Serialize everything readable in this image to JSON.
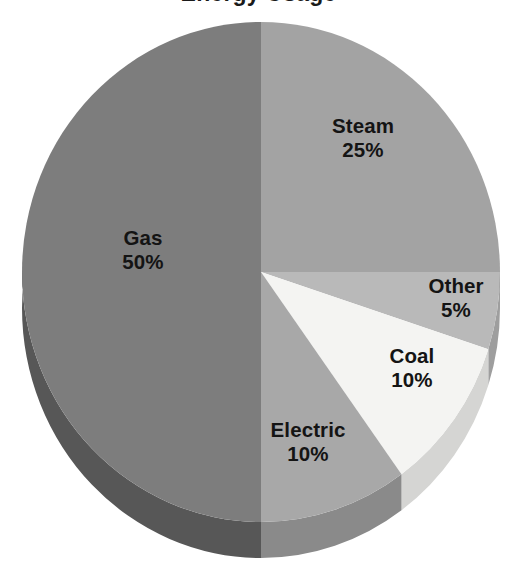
{
  "chart_data": {
    "type": "pie",
    "title": "Energy Usage",
    "title_cropped": true,
    "xlabel": "",
    "ylabel": "",
    "legend_position": "none",
    "grid": false,
    "labels_on_slices": true,
    "three_d": true,
    "start_angle_deg": 0,
    "direction": "clockwise",
    "categories": [
      "Steam",
      "Other",
      "Coal",
      "Electric",
      "Gas"
    ],
    "values": [
      25,
      5,
      10,
      10,
      50
    ],
    "unit": "%",
    "slices": [
      {
        "name": "Steam",
        "value": 25,
        "value_label": "25%",
        "color": "#a3a3a3",
        "side_color": "#8d8d8d",
        "start_deg": 0,
        "end_deg": 90
      },
      {
        "name": "Other",
        "value": 5,
        "value_label": "5%",
        "color": "#b9b9b9",
        "side_color": "#9e9e9e",
        "start_deg": 90,
        "end_deg": 108
      },
      {
        "name": "Coal",
        "value": 10,
        "value_label": "10%",
        "color": "#f4f4f2",
        "side_color": "#d5d5d3",
        "start_deg": 108,
        "end_deg": 144
      },
      {
        "name": "Electric",
        "value": 10,
        "value_label": "10%",
        "color": "#a8a8a8",
        "side_color": "#8a8a8a",
        "start_deg": 144,
        "end_deg": 180
      },
      {
        "name": "Gas",
        "value": 50,
        "value_label": "50%",
        "color": "#7d7d7d",
        "side_color": "#575757",
        "start_deg": 180,
        "end_deg": 360
      }
    ],
    "colors": {
      "background": "#ffffff",
      "text": "#141414",
      "steam": "#a3a3a3",
      "other": "#b9b9b9",
      "coal": "#f4f4f2",
      "electric": "#a8a8a8",
      "gas": "#7d7d7d"
    }
  },
  "labels": {
    "gas": {
      "name": "Gas",
      "value": "50%"
    },
    "steam": {
      "name": "Steam",
      "value": "25%"
    },
    "other": {
      "name": "Other",
      "value": "5%"
    },
    "coal": {
      "name": "Coal",
      "value": "10%"
    },
    "electric": {
      "name": "Electric",
      "value": "10%"
    }
  }
}
